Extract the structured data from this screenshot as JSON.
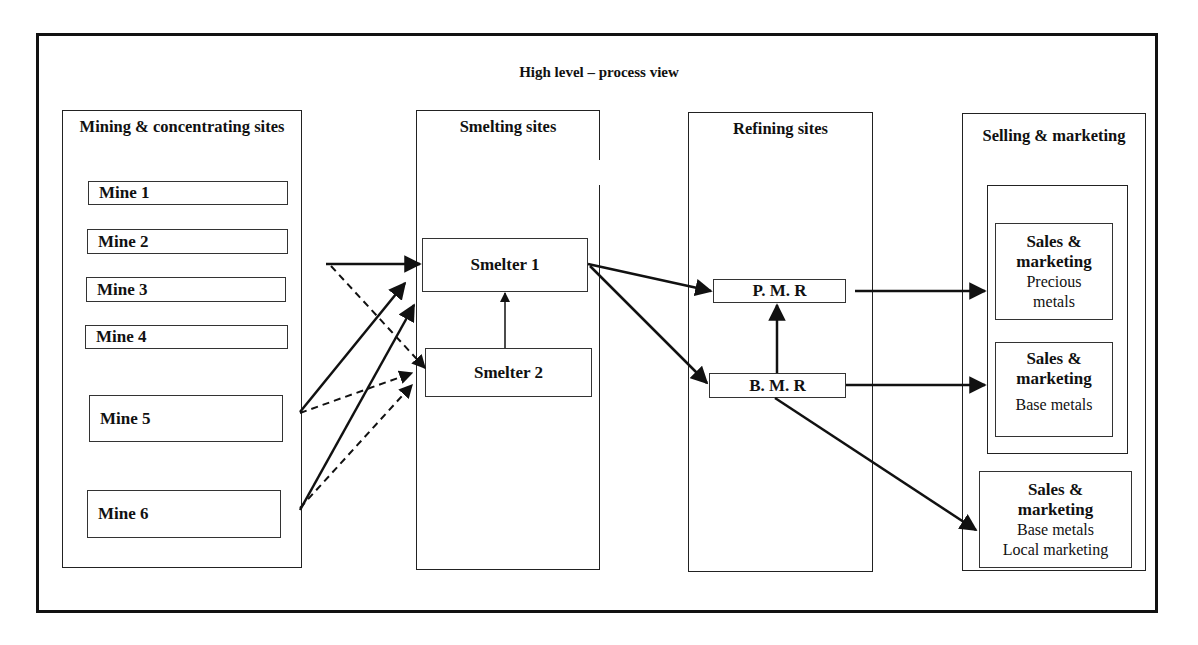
{
  "diagram": {
    "title": "High level – process view",
    "columns": {
      "mining": {
        "title": "Mining & concentrating sites",
        "mines": [
          "Mine 1",
          "Mine 2",
          "Mine 3",
          "Mine 4",
          "Mine 5",
          "Mine 6"
        ]
      },
      "smelting": {
        "title": "Smelting sites",
        "smelters": [
          "Smelter 1",
          "Smelter 2"
        ]
      },
      "refining": {
        "title": "Refining sites",
        "refineries": [
          "P. M. R",
          "B. M. R"
        ]
      },
      "selling": {
        "title": "Selling & marketing",
        "units": [
          {
            "heading": "Sales & marketing",
            "sub": "Precious metals"
          },
          {
            "heading": "Sales & marketing",
            "sub": "Base metals"
          },
          {
            "heading": "Sales & marketing",
            "sub": "Base metals",
            "sub2": "Local marketing"
          }
        ]
      }
    },
    "flows": [
      {
        "from": "Mine 2/3 region",
        "to": "Smelter 1",
        "style": "solid"
      },
      {
        "from": "Mine 2/3 region",
        "to": "Smelter 2",
        "style": "dashed"
      },
      {
        "from": "Mine 5",
        "to": "Smelter 1",
        "style": "solid"
      },
      {
        "from": "Mine 5",
        "to": "Smelter 2",
        "style": "dashed"
      },
      {
        "from": "Mine 6",
        "to": "Smelter 1",
        "style": "solid"
      },
      {
        "from": "Mine 6",
        "to": "Smelter 2",
        "style": "dashed"
      },
      {
        "from": "Smelter 2",
        "to": "Smelter 1",
        "style": "solid"
      },
      {
        "from": "Smelter 1",
        "to": "P. M. R",
        "style": "solid"
      },
      {
        "from": "Smelter 1",
        "to": "B. M. R",
        "style": "solid"
      },
      {
        "from": "B. M. R",
        "to": "P. M. R",
        "style": "solid"
      },
      {
        "from": "P. M. R",
        "to": "Sales & marketing Precious metals",
        "style": "solid"
      },
      {
        "from": "B. M. R",
        "to": "Sales & marketing Base metals",
        "style": "solid"
      },
      {
        "from": "B. M. R",
        "to": "Sales & marketing Base metals Local marketing",
        "style": "solid"
      }
    ]
  }
}
